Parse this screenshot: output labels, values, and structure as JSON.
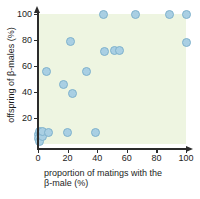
{
  "chart_data": {
    "type": "scatter",
    "title": "",
    "xlabel": "proportion of matings with the β-male (%)",
    "xlabel_line1": "proportion of matings with the",
    "xlabel_line2": "β-male (%)",
    "ylabel": "offspring of β-males (%)",
    "xlim": [
      0,
      100
    ],
    "ylim": [
      0,
      100
    ],
    "xticks": [
      0,
      20,
      40,
      60,
      80,
      100
    ],
    "yticks": [
      20,
      40,
      60,
      80,
      100
    ],
    "xtick_labels": [
      "0",
      "20",
      "40",
      "60",
      "80",
      "100"
    ],
    "ytick_labels": [
      "20",
      "40",
      "60",
      "80",
      "100"
    ],
    "grid": false,
    "legend": "none",
    "plot_background_color": "#eef5e1",
    "marker_fill_color": "#a9cfe3",
    "marker_edge_color": "#7fb2cc",
    "axis_color": "#2b2b2b",
    "n_points": 22,
    "points": [
      {
        "x": 0,
        "y": 7
      },
      {
        "x": 0,
        "y": 4
      },
      {
        "x": 1,
        "y": 10
      },
      {
        "x": 1,
        "y": 2
      },
      {
        "x": 2,
        "y": 8
      },
      {
        "x": 3,
        "y": 6
      },
      {
        "x": 3,
        "y": 10
      },
      {
        "x": 7,
        "y": 9
      },
      {
        "x": 6,
        "y": 56
      },
      {
        "x": 17,
        "y": 46
      },
      {
        "x": 20,
        "y": 9
      },
      {
        "x": 22,
        "y": 79
      },
      {
        "x": 23,
        "y": 39
      },
      {
        "x": 33,
        "y": 56
      },
      {
        "x": 39,
        "y": 9
      },
      {
        "x": 44,
        "y": 100
      },
      {
        "x": 45,
        "y": 71
      },
      {
        "x": 52,
        "y": 72
      },
      {
        "x": 55,
        "y": 72
      },
      {
        "x": 66,
        "y": 100
      },
      {
        "x": 89,
        "y": 100
      },
      {
        "x": 100,
        "y": 100
      },
      {
        "x": 100,
        "y": 78
      }
    ]
  }
}
